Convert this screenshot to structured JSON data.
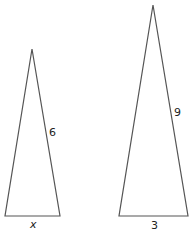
{
  "figure": {
    "triangles": [
      {
        "id": "small",
        "side_label": "6",
        "base_label": "x",
        "apex": [
          32,
          49
        ],
        "base_left": [
          5,
          216
        ],
        "base_right": [
          60,
          216
        ]
      },
      {
        "id": "large",
        "side_label": "9",
        "base_label": "3",
        "apex": [
          153,
          5
        ],
        "base_left": [
          119,
          216
        ],
        "base_right": [
          188,
          216
        ]
      }
    ]
  }
}
